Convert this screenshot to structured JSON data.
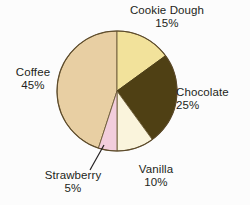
{
  "chart_data": {
    "type": "pie",
    "title": "",
    "subtitle": "",
    "xlabel": "",
    "ylabel": "",
    "legend_position": "none",
    "grid": false,
    "units": "percent",
    "total": 100,
    "start_angle_deg": 0,
    "direction": "clockwise",
    "categories": [
      "Cookie Dough",
      "Chocolate",
      "Vanilla",
      "Strawberry",
      "Coffee"
    ],
    "values": [
      15,
      25,
      10,
      5,
      45
    ],
    "slices": [
      {
        "label": "Cookie Dough",
        "value": 15,
        "value_text": "15%",
        "color": "#f2e29b",
        "start_deg": 0,
        "end_deg": 54,
        "label_position": "top",
        "has_leader_line": false
      },
      {
        "label": "Chocolate",
        "value": 25,
        "value_text": "25%",
        "color": "#4f4014",
        "start_deg": 54,
        "end_deg": 144,
        "label_position": "right",
        "has_leader_line": false
      },
      {
        "label": "Vanilla",
        "value": 10,
        "value_text": "10%",
        "color": "#faf4dc",
        "start_deg": 144,
        "end_deg": 180,
        "label_position": "bottom",
        "has_leader_line": false
      },
      {
        "label": "Strawberry",
        "value": 5,
        "value_text": "5%",
        "color": "#f2cddc",
        "start_deg": 180,
        "end_deg": 198,
        "label_position": "bottom-left",
        "has_leader_line": true
      },
      {
        "label": "Coffee",
        "value": 45,
        "value_text": "45%",
        "color": "#e8cfa3",
        "start_deg": 198,
        "end_deg": 360,
        "label_position": "left",
        "has_leader_line": false
      }
    ],
    "geometry": {
      "center_x": 117,
      "center_y": 91,
      "radius": 60,
      "outline_color": "#5c4a2a",
      "divider_color": "#8a7a5a",
      "background": "#fcfcfc"
    }
  }
}
